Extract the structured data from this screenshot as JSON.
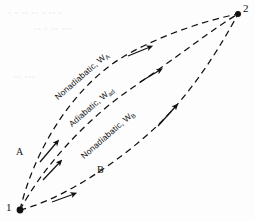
{
  "figure": {
    "type": "thermodynamic-process-diagram",
    "background_color": "#fdfdfd",
    "ink_color": "#111111",
    "width": 255,
    "height": 222
  },
  "points": [
    {
      "id": "state-1",
      "label": "1",
      "x": 20,
      "y": 210,
      "label_x": 6,
      "label_y": 203
    },
    {
      "id": "state-2",
      "label": "2",
      "x": 238,
      "y": 14,
      "label_x": 243,
      "label_y": 2
    }
  ],
  "paths": [
    {
      "id": "upper-path",
      "label": "Nonadiabatic,",
      "symbol": "W",
      "subscript": "A",
      "branch_label": "A",
      "direction": "1-to-2",
      "style": "dashed",
      "label_x": 56,
      "label_y": 93,
      "label_rotation": -41,
      "branch_x": 16,
      "branch_y": 152
    },
    {
      "id": "middle-path",
      "label": "Adiabatic,",
      "symbol": "W",
      "subscript": "ad",
      "branch_label": "",
      "direction": "1-to-2",
      "style": "dashed",
      "label_x": 70,
      "label_y": 120,
      "label_rotation": -41,
      "branch_x": 0,
      "branch_y": 0
    },
    {
      "id": "lower-path",
      "label": "Nonadiabatic,",
      "symbol": "W",
      "subscript": "B",
      "branch_label": "B",
      "direction": "1-to-2",
      "style": "dashed",
      "label_x": 82,
      "label_y": 152,
      "label_rotation": -41,
      "branch_x": 97,
      "branch_y": 170
    }
  ],
  "ghost_text": [
    {
      "text": "• • •• •• • •• •",
      "x": 8,
      "y": 8
    },
    {
      "text": "•• • •• •••",
      "x": 34,
      "y": 24
    },
    {
      "text": "•• •••",
      "x": 14,
      "y": 72
    }
  ]
}
